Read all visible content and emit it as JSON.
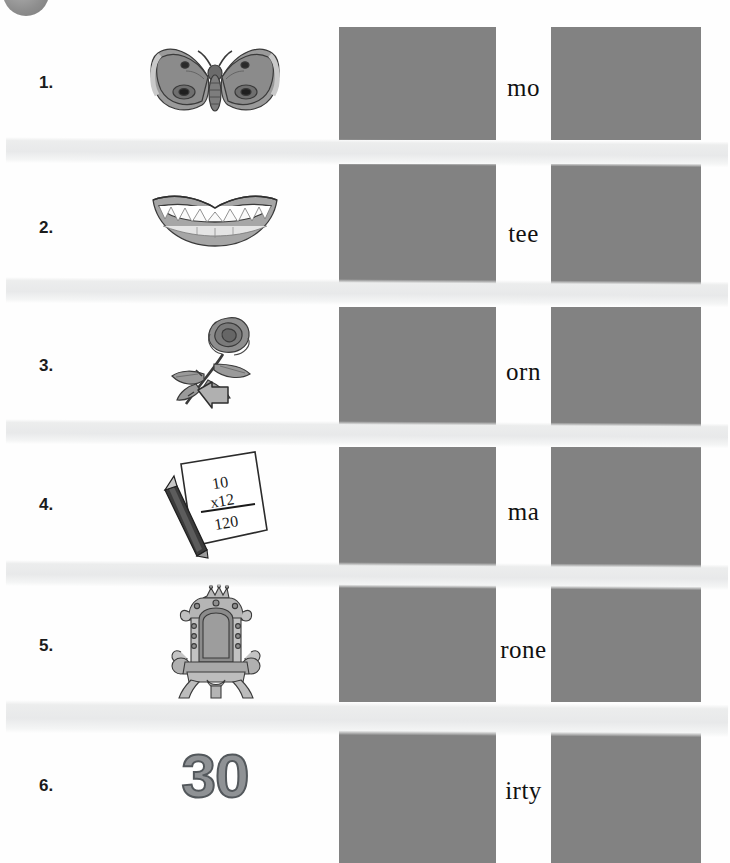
{
  "worksheet": {
    "title": "th words picture-word matching worksheet",
    "theme": "digraph-th",
    "corner_badge": "gray-circle-badge",
    "colors": {
      "page_background": "#fefefe",
      "redaction_box": "#828282",
      "stripe": "#eceded",
      "row_number": "#1b1b1b",
      "word_text": "#111111",
      "illustration_gray": "#8f9295",
      "illustration_outline": "#3a3a3a"
    },
    "rows": [
      {
        "number": "1.",
        "picture": "moth",
        "picture_icon": "moth-icon",
        "word_fragment": "mo",
        "blank_before": true,
        "blank_after": true
      },
      {
        "number": "2.",
        "picture": "teeth",
        "picture_icon": "teeth-icon",
        "word_fragment": "tee",
        "blank_before": true,
        "blank_after": true
      },
      {
        "number": "3.",
        "picture": "thorn",
        "picture_icon": "rose-thorn-icon",
        "word_fragment": "orn",
        "blank_before": true,
        "blank_after": true
      },
      {
        "number": "4.",
        "picture": "math",
        "picture_icon": "math-paper-icon",
        "word_fragment": "ma",
        "blank_before": true,
        "blank_after": true
      },
      {
        "number": "5.",
        "picture": "throne",
        "picture_icon": "throne-icon",
        "word_fragment": "rone",
        "blank_before": true,
        "blank_after": true
      },
      {
        "number": "6.",
        "picture": "thirty",
        "picture_icon": "number-thirty-icon",
        "picture_text": "30",
        "word_fragment": "irty",
        "blank_before": true,
        "blank_after": true
      }
    ],
    "math_paper": {
      "line1": "10",
      "line2": "x12",
      "line3": "120"
    },
    "stripe_count": 5
  }
}
